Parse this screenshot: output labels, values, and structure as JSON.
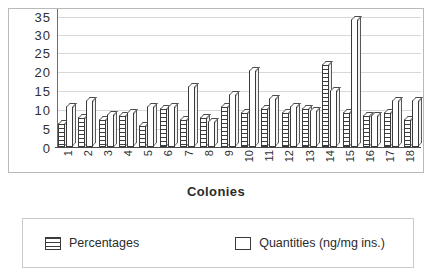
{
  "chart_data": {
    "type": "bar",
    "title": "",
    "xlabel": "Colonies",
    "ylabel": "",
    "ylim": [
      0,
      35
    ],
    "yticks": [
      0,
      5,
      10,
      15,
      20,
      25,
      30,
      35
    ],
    "grid": true,
    "legend_position": "bottom",
    "categories": [
      "1",
      "2",
      "3",
      "4",
      "5",
      "6",
      "7",
      "8",
      "9",
      "10",
      "11",
      "12",
      "13",
      "14",
      "15",
      "16",
      "17",
      "18"
    ],
    "series": [
      {
        "name": "Percentages",
        "swatch": "hatched",
        "values": [
          6,
          7.5,
          7,
          8,
          5.5,
          10,
          7,
          7.5,
          10.5,
          9,
          10,
          9,
          10,
          21,
          9,
          8,
          9,
          7
        ]
      },
      {
        "name": "Quantities (ng/mg ins.)",
        "swatch": "solid-white",
        "values": [
          10.5,
          12,
          8.5,
          9,
          10.5,
          10.5,
          15.5,
          6.5,
          13.5,
          19.5,
          12.5,
          10.5,
          9.5,
          14.5,
          32.5,
          8,
          12,
          12
        ]
      }
    ]
  },
  "axis": {
    "x_title": "Colonies",
    "y_tick_labels": [
      "35",
      "30",
      "25",
      "20",
      "15",
      "10",
      "5",
      "0"
    ],
    "x_tick_labels": [
      "1",
      "2",
      "3",
      "4",
      "5",
      "6",
      "7",
      "8",
      "9",
      "10",
      "11",
      "12",
      "13",
      "14",
      "15",
      "16",
      "17",
      "18"
    ]
  },
  "legend": {
    "entries": [
      {
        "label": "Percentages"
      },
      {
        "label": "Quantities  (ng/mg  ins.)"
      }
    ]
  },
  "colors": {
    "bar_outline": "#3a3a3a",
    "hatch": "#3d3d3d",
    "bar_fill": "#ffffff",
    "gridline": "#d8d8d8",
    "frame": "#b9b9b9",
    "axis": "#4a4a4a",
    "text": "#2b2b2b"
  }
}
